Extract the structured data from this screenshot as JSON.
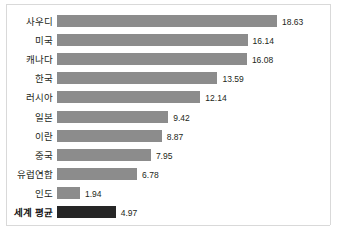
{
  "chart_data": {
    "type": "bar",
    "orientation": "horizontal",
    "title": "",
    "subtitle": "",
    "xlabel": "",
    "ylabel": "",
    "grid": false,
    "legend": false,
    "xlim": [
      0,
      18.63
    ],
    "categories": [
      "사우디",
      "미국",
      "캐나다",
      "한국",
      "러시아",
      "일본",
      "이란",
      "중국",
      "유럽연합",
      "인도",
      "세계 평균"
    ],
    "values": [
      18.63,
      16.14,
      16.08,
      13.59,
      12.14,
      9.42,
      8.87,
      7.95,
      6.78,
      1.94,
      4.97
    ],
    "value_labels": [
      "18.63",
      "16.14",
      "16.08",
      "13.59",
      "12.14",
      "9.42",
      "8.87",
      "7.95",
      "6.78",
      "1.94",
      "4.97"
    ],
    "highlight_index": 10,
    "colors": {
      "bar": "#8c8c8c",
      "bar_highlight": "#262626",
      "text": "#231f20",
      "frame": "#d9d9d9",
      "background": "#ffffff"
    }
  }
}
